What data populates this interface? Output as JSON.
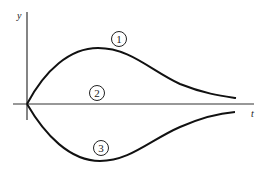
{
  "axes": {
    "y_label": "y",
    "x_label": "t",
    "origin": [
      27,
      104
    ],
    "y_axis": {
      "x": 27,
      "y_top": 12,
      "y_bottom": 120
    },
    "x_axis": {
      "y": 104,
      "x_left": 13,
      "x_right": 254
    }
  },
  "curves": [
    {
      "id": "1",
      "label": "1",
      "description": "rises from origin to a maximum then decays toward axis"
    },
    {
      "id": "2",
      "label": "2",
      "description": "remains on the t-axis (y = 0)"
    },
    {
      "id": "3",
      "label": "3",
      "description": "falls from origin to a minimum then returns toward axis"
    }
  ],
  "colors": {
    "line": "#111111",
    "axis": "#333333"
  }
}
